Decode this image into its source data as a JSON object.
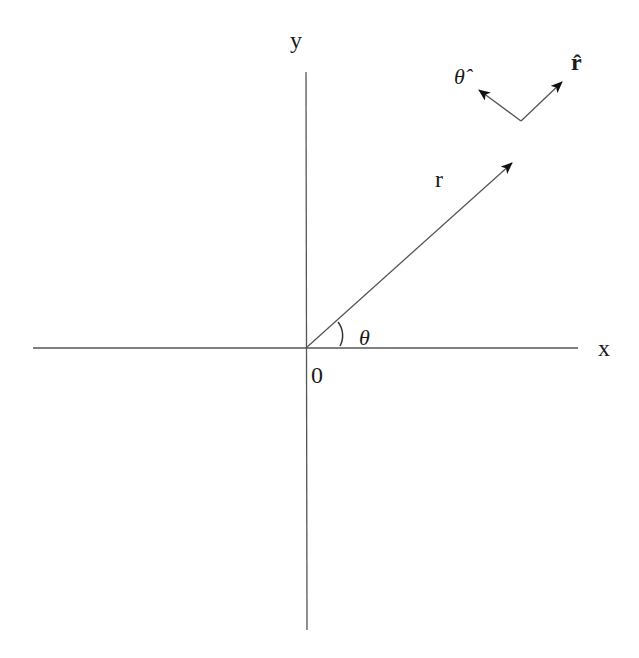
{
  "diagram": {
    "axes": {
      "x_label": "x",
      "y_label": "y",
      "origin_label": "0"
    },
    "vector": {
      "label": "r"
    },
    "angle": {
      "label": "θ"
    },
    "unit_vectors": {
      "r_hat_label": "r̂",
      "theta_hat_label": "θ̂"
    },
    "colors": {
      "line": "#555555",
      "text": "#1a1a1a",
      "background": "#ffffff"
    }
  }
}
